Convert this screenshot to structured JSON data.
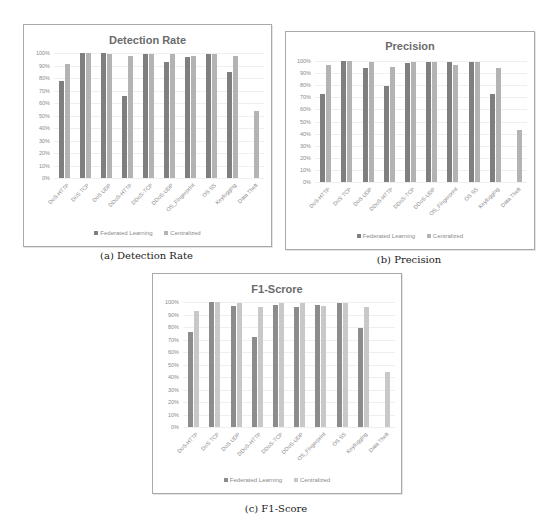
{
  "colors": {
    "federated": "#7f7f7f",
    "centralized": "#b3b3b3",
    "centralized_f1": "#c8c8c8",
    "federated_f1": "#8c8c8c"
  },
  "legend": {
    "federated": "Federated Learning",
    "centralized": "Centralized"
  },
  "captions": {
    "a": "(a) Detection Rate",
    "b": "(b) Precision",
    "c": "(c) F1-Score"
  },
  "y_ticks": [
    "0%",
    "10%",
    "20%",
    "30%",
    "40%",
    "50%",
    "60%",
    "70%",
    "80%",
    "90%",
    "100%"
  ],
  "chart_data": [
    {
      "type": "bar",
      "title": "Detection Rate",
      "caption": "(a) Detection Rate",
      "xlabel": "",
      "ylabel": "",
      "ylim": [
        0,
        100
      ],
      "grid": true,
      "legend_position": "bottom",
      "categories": [
        "DoS-HTTP",
        "DoS TCP",
        "DoS UDP",
        "DDoS-HTTP",
        "DDoS-TCP",
        "DDoS-UDP",
        "OS_Fingerprint",
        "OS SS",
        "Keylogging",
        "Data Theft"
      ],
      "series": [
        {
          "name": "Federated Learning",
          "values": [
            78,
            100,
            100,
            66,
            99,
            93,
            97,
            99,
            85,
            0
          ]
        },
        {
          "name": "Centralized",
          "values": [
            91,
            100,
            99,
            98,
            99,
            99,
            98,
            99,
            98,
            54
          ]
        }
      ]
    },
    {
      "type": "bar",
      "title": "Precision",
      "caption": "(b) Precision",
      "xlabel": "",
      "ylabel": "",
      "ylim": [
        0,
        100
      ],
      "grid": true,
      "legend_position": "bottom",
      "categories": [
        "DoS-HTTP",
        "DoS TCP",
        "DoS UDP",
        "DDoS-HTTP",
        "DDoS-TCP",
        "DDoS-UDP",
        "OS_Fingerprint",
        "OS SS",
        "Keylogging",
        "Data Theft"
      ],
      "series": [
        {
          "name": "Federated Learning",
          "values": [
            73,
            100,
            94,
            79,
            98,
            99,
            99,
            99,
            73,
            0
          ]
        },
        {
          "name": "Centralized",
          "values": [
            97,
            100,
            99,
            95,
            99,
            99,
            97,
            99,
            94,
            43
          ]
        }
      ]
    },
    {
      "type": "bar",
      "title": "F1-Scrore",
      "caption": "(c) F1-Score",
      "xlabel": "",
      "ylabel": "",
      "ylim": [
        0,
        100
      ],
      "grid": true,
      "legend_position": "bottom",
      "categories": [
        "DoS-HTTP",
        "DoS TCP",
        "DoS UDP",
        "DDoS-HTTP",
        "DDoS-TCP",
        "DDoS-UDP",
        "OS_Fingerprint",
        "OS SS",
        "Keylogging",
        "Data Theft"
      ],
      "series": [
        {
          "name": "Federated Learning",
          "values": [
            76,
            100,
            97,
            72,
            98,
            96,
            98,
            99,
            79,
            0
          ]
        },
        {
          "name": "Centralized",
          "values": [
            93,
            100,
            99,
            96,
            99,
            99,
            97,
            99,
            96,
            44
          ]
        }
      ]
    }
  ]
}
